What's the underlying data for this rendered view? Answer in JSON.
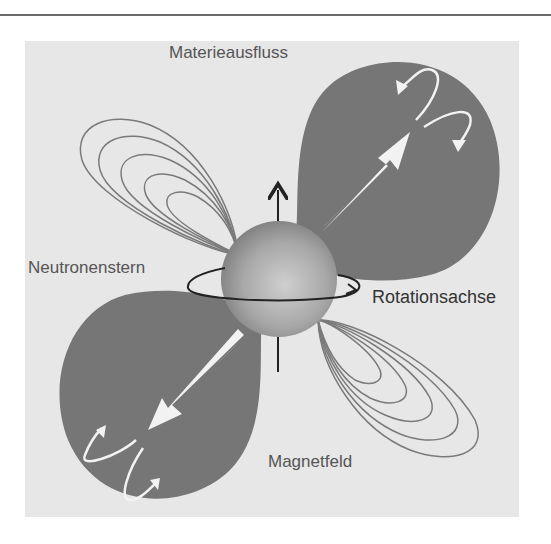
{
  "diagram": {
    "title": "Neutronenstern",
    "labels": {
      "outflow": "Materieausfluss",
      "neutron_star": "Neutronenstern",
      "rotation_axis": "Rotationsachse",
      "magnetic_field": "Magnetfeld"
    },
    "colors": {
      "background": "#ffffff",
      "panel": "#e7e7e7",
      "lobe": "#767676",
      "sphere_light": "#c9c9c9",
      "sphere_dark": "#7e7e7e",
      "field_lines": "#7a7a7a",
      "axis": "#222222",
      "arrows": "#f2f2f2"
    }
  }
}
